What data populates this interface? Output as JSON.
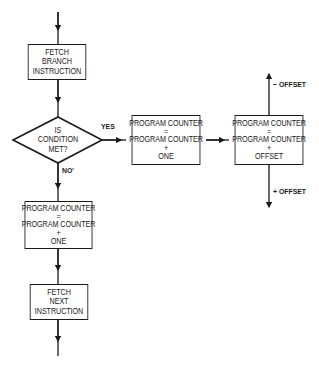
{
  "diagram": {
    "type": "flowchart",
    "title": "",
    "nodes": {
      "fetch_branch": {
        "shape": "rect",
        "lines": [
          "FETCH",
          "BRANCH",
          "INSTRUCTION"
        ]
      },
      "decision": {
        "shape": "diamond",
        "lines": [
          "IS",
          "CONDITION",
          "MET?"
        ]
      },
      "pc_plus_one_yes": {
        "shape": "rect",
        "lines": [
          "PROGRAM COUNTER",
          "=",
          "PROGRAM COUNTER",
          "+",
          "ONE"
        ]
      },
      "pc_plus_offset": {
        "shape": "rect",
        "lines": [
          "PROGRAM COUNTER",
          "=",
          "PROGRAM COUNTER",
          "+",
          "OFFSET"
        ]
      },
      "pc_plus_one_no": {
        "shape": "rect",
        "lines": [
          "PROGRAM COUNTER",
          "=",
          "PROGRAM COUNTER",
          "+",
          "ONE"
        ]
      },
      "fetch_next": {
        "shape": "rect",
        "lines": [
          "FETCH",
          "NEXT",
          "INSTRUCTION"
        ]
      }
    },
    "edges": [
      {
        "from": "entry",
        "to": "fetch_branch",
        "label": ""
      },
      {
        "from": "fetch_branch",
        "to": "decision",
        "label": ""
      },
      {
        "from": "decision",
        "to": "pc_plus_one_yes",
        "label": "YES"
      },
      {
        "from": "pc_plus_one_yes",
        "to": "pc_plus_offset",
        "label": ""
      },
      {
        "from": "pc_plus_offset",
        "to": "up",
        "label": "− OFFSET"
      },
      {
        "from": "pc_plus_offset",
        "to": "down",
        "label": "+ OFFSET"
      },
      {
        "from": "decision",
        "to": "pc_plus_one_no",
        "label": "NO'"
      },
      {
        "from": "pc_plus_one_no",
        "to": "fetch_next",
        "label": ""
      },
      {
        "from": "fetch_next",
        "to": "exit",
        "label": ""
      }
    ],
    "labels": {
      "yes": "YES",
      "no": "NO'",
      "minus_offset": "− OFFSET",
      "plus_offset": "+ OFFSET"
    },
    "colors": {
      "line": "#1a1a1a",
      "background": "#ffffff"
    }
  }
}
